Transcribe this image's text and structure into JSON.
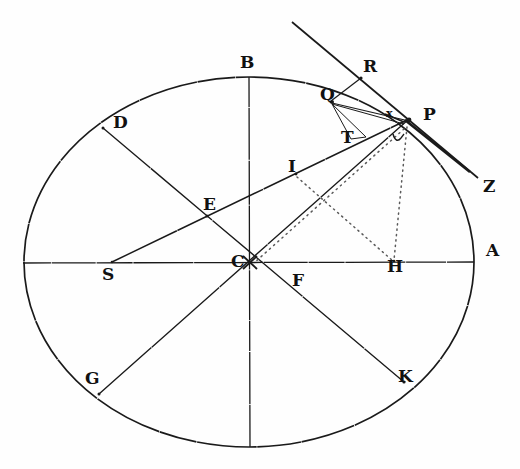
{
  "figure": {
    "name": "ellipse-orbit-geometry-diagram",
    "background_color": "#fefefe",
    "ink_color": "#1a1a1a",
    "width": 520,
    "height": 469
  },
  "ellipse": {
    "center_label": "C",
    "cx": 249,
    "cy": 262,
    "rx": 225,
    "ry": 185,
    "stroke": "#1a1a1a",
    "stroke_width": 1.6
  },
  "points": [
    {
      "id": "A",
      "label": "A",
      "x": 474,
      "y": 262,
      "label_x": 486,
      "label_y": 242,
      "size": "big",
      "note": "right end of major axis"
    },
    {
      "id": "S",
      "label": "S",
      "x": 112,
      "y": 262,
      "label_x": 102,
      "label_y": 266,
      "size": "big",
      "note": "focus on major axis"
    },
    {
      "id": "B",
      "label": "B",
      "x": 249,
      "y": 77,
      "label_x": 240,
      "label_y": 54,
      "size": "big",
      "note": "top of minor axis"
    },
    {
      "id": "C",
      "label": "C",
      "x": 249,
      "y": 262,
      "label_x": 231,
      "label_y": 253,
      "size": "big",
      "note": "center"
    },
    {
      "id": "D",
      "label": "D",
      "x": 103,
      "y": 128,
      "label_x": 113,
      "label_y": 114,
      "size": "big",
      "note": "on ellipse upper-left"
    },
    {
      "id": "E",
      "label": "E",
      "x": 207,
      "y": 216,
      "label_x": 203,
      "label_y": 196,
      "size": "big",
      "note": "intersection D-K with S-P"
    },
    {
      "id": "F",
      "label": "F",
      "x": 297,
      "y": 272,
      "label_x": 292,
      "label_y": 272,
      "size": "big",
      "note": "label below axis right of C"
    },
    {
      "id": "G",
      "label": "G",
      "x": 99,
      "y": 394,
      "label_x": 85,
      "label_y": 370,
      "size": "big",
      "note": "on ellipse lower-left"
    },
    {
      "id": "H",
      "label": "H",
      "x": 394,
      "y": 262,
      "label_x": 387,
      "label_y": 258,
      "size": "big",
      "note": "foot of perpendicular from P"
    },
    {
      "id": "I",
      "label": "I",
      "x": 295,
      "y": 172,
      "label_x": 288,
      "label_y": 158,
      "size": "big",
      "note": "on line S-P"
    },
    {
      "id": "K",
      "label": "K",
      "x": 404,
      "y": 382,
      "label_x": 398,
      "label_y": 368,
      "size": "big",
      "note": "on ellipse lower-right"
    },
    {
      "id": "P",
      "label": "P",
      "x": 409,
      "y": 119,
      "label_x": 423,
      "label_y": 106,
      "size": "big",
      "note": "orbiting body on ellipse"
    },
    {
      "id": "Q",
      "label": "Q",
      "x": 331,
      "y": 101,
      "label_x": 320,
      "label_y": 86,
      "size": "big",
      "note": "nearby point on ellipse"
    },
    {
      "id": "R",
      "label": "R",
      "x": 360,
      "y": 77,
      "label_x": 363,
      "label_y": 58,
      "size": "big",
      "note": "on tangent at P"
    },
    {
      "id": "T",
      "label": "T",
      "x": 350,
      "y": 131,
      "label_x": 341,
      "label_y": 129,
      "size": "big",
      "note": "foot on line S-P"
    },
    {
      "id": "Z",
      "label": "Z",
      "x": 478,
      "y": 178,
      "label_x": 483,
      "label_y": 178,
      "size": "big",
      "note": "far end of tangent line"
    },
    {
      "id": "x",
      "label": "x",
      "x": 393,
      "y": 115,
      "label_x": 388,
      "label_y": 110,
      "size": "small",
      "note": "small mark left of P"
    },
    {
      "id": "v",
      "label": "v",
      "x": 398,
      "y": 143,
      "label_x": 393,
      "label_y": 136,
      "size": "tiny",
      "note": "small italic mark below P"
    }
  ],
  "lines": [
    {
      "name": "major-axis-S-A",
      "from": "left-vertex",
      "to": "right-vertex",
      "x1": 23,
      "y1": 263,
      "x2": 474,
      "y2": 262,
      "style": "solid"
    },
    {
      "name": "minor-axis-B-bottom",
      "from": "B",
      "to": "bottom-vertex",
      "x1": 249,
      "y1": 77,
      "x2": 250,
      "y2": 447,
      "style": "solid"
    },
    {
      "name": "diameter-D-K",
      "from": "D",
      "to": "K",
      "x1": 103,
      "y1": 128,
      "x2": 404,
      "y2": 382,
      "style": "solid"
    },
    {
      "name": "diameter-G-P",
      "from": "G",
      "to": "P",
      "x1": 99,
      "y1": 394,
      "x2": 409,
      "y2": 119,
      "style": "solid"
    },
    {
      "name": "radius-vector-S-P",
      "from": "S",
      "to": "P",
      "x1": 112,
      "y1": 262,
      "x2": 409,
      "y2": 119,
      "style": "solid"
    },
    {
      "name": "tangent-at-P",
      "from": "upper-left",
      "to": "Z",
      "x1": 292,
      "y1": 22,
      "x2": 478,
      "y2": 178,
      "style": "solid"
    },
    {
      "name": "chord-Q-R",
      "from": "Q",
      "to": "R",
      "x1": 331,
      "y1": 101,
      "x2": 360,
      "y2": 77,
      "style": "solid"
    },
    {
      "name": "chord-Q-P",
      "from": "Q",
      "to": "P",
      "x1": 331,
      "y1": 101,
      "x2": 409,
      "y2": 119,
      "style": "solid"
    },
    {
      "name": "chord-Q-x",
      "from": "Q",
      "to": "x",
      "x1": 331,
      "y1": 101,
      "x2": 392,
      "y2": 117,
      "style": "solid"
    },
    {
      "name": "segment-Q-T",
      "from": "Q",
      "to": "T",
      "x1": 331,
      "y1": 101,
      "x2": 352,
      "y2": 136,
      "style": "solid"
    },
    {
      "name": "segment-Q-below-T",
      "from": "Q",
      "to": "T-foot",
      "x1": 331,
      "y1": 101,
      "x2": 364,
      "y2": 135,
      "style": "solid"
    },
    {
      "name": "dotted-P-H",
      "from": "P",
      "to": "H",
      "x1": 408,
      "y1": 124,
      "x2": 394,
      "y2": 262,
      "style": "dotted"
    },
    {
      "name": "dotted-I-H",
      "from": "I",
      "to": "H",
      "x1": 297,
      "y1": 176,
      "x2": 394,
      "y2": 262,
      "style": "dotted"
    },
    {
      "name": "dotted-P-C",
      "from": "P",
      "to": "C",
      "x1": 406,
      "y1": 126,
      "x2": 252,
      "y2": 264,
      "style": "dotted"
    },
    {
      "name": "dotted-C-H-axis",
      "from": "C",
      "to": "H",
      "x1": 252,
      "y1": 264,
      "x2": 394,
      "y2": 262,
      "style": "dotted"
    }
  ],
  "caption": {
    "title": "",
    "description": ""
  }
}
